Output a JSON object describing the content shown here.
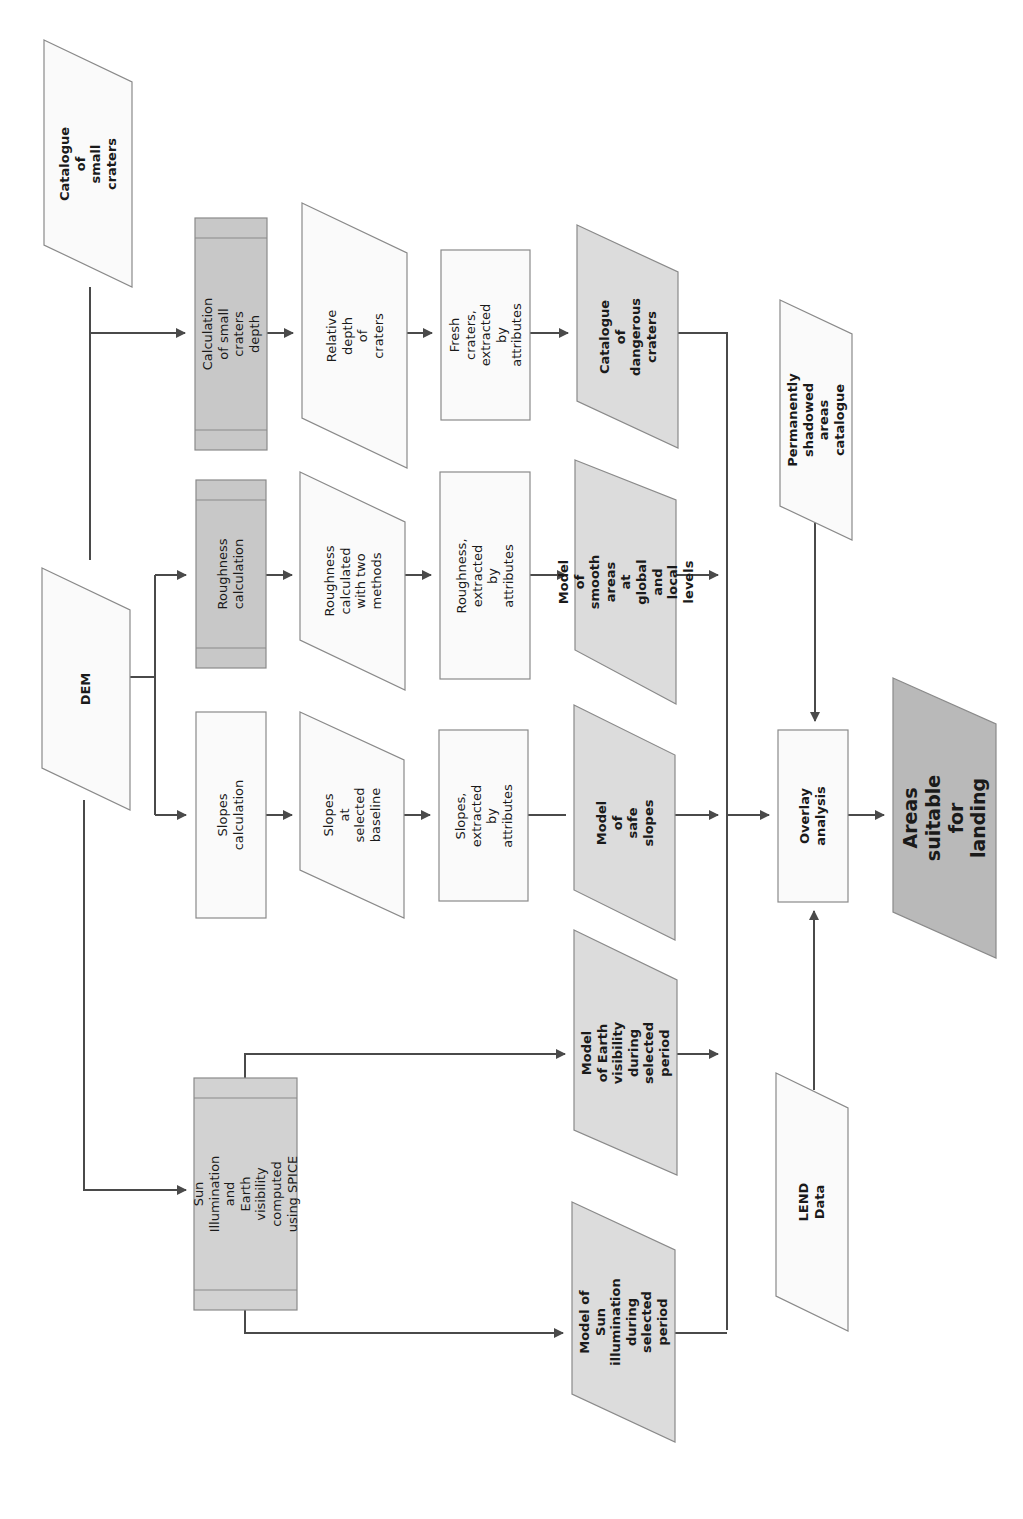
{
  "diagram": {
    "orientation": "rotated-90-ccw",
    "colors": {
      "line": "#4a4a4a",
      "process_dark": "#c8c8c8",
      "result_grey": "#dcdcdc",
      "final_grey": "#b9b9b9",
      "input_white": "#fafafa"
    },
    "nodes": {
      "catalogue_small_craters": "Catalogue of\nsmall craters",
      "dem": "DEM",
      "calc_crater_depth": "Calculation of small\ncraters depth",
      "roughness_calc": "Roughness\ncalculation",
      "slopes_calc": "Slopes calculation",
      "relative_depth": "Relative depth\nof craters",
      "roughness_two_methods": "Roughness\ncalculated\nwith two\nmethods",
      "slopes_baseline": "Slopes at\nselected\nbaseline",
      "fresh_craters": "Fresh craters,\nextracted by\nattributes",
      "roughness_extracted": "Roughness,\nextracted by\nattributes",
      "slopes_extracted": "Slopes,\nextracted by\nattributes",
      "catalogue_dangerous": "Catalogue of\ndangerous\ncraters",
      "smooth_areas": "Model of\nsmooth areas\nat global and\nlocal levels",
      "safe_slopes": "Model  of\nsafe slopes",
      "earth_visibility": "Model of Earth\nvisibility during\nselected period",
      "sun_illumination_model": "Model of  Sun\nillumination\nduring selected\nperiod",
      "spice": "Sun Illumination and\nEarth visibility\ncomputed using SPICE",
      "shadowed": "Permanently\nshadowed areas\ncatalogue",
      "overlay": "Overlay analysis",
      "areas_suitable": "Areas suitable\nfor landing",
      "lend": "LEND Data"
    }
  }
}
